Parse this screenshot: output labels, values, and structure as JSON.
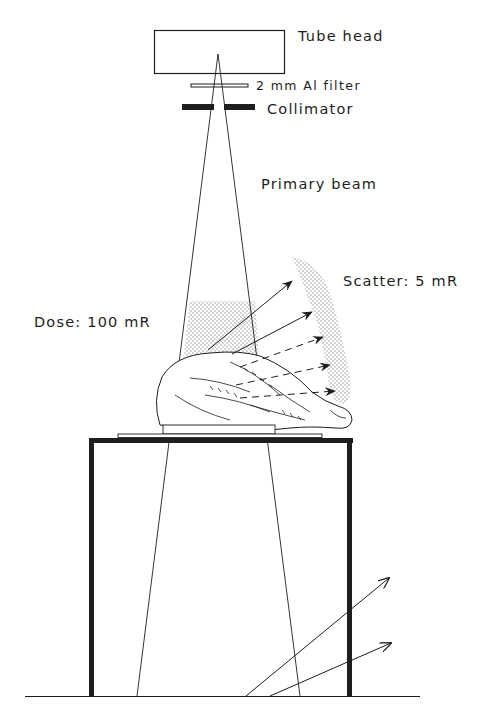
{
  "diagram": {
    "type": "radiography-scatter-setup",
    "labels": {
      "tube_head": "Tube head",
      "filter": "2 mm Al filter",
      "collimator": "Collimator",
      "primary_beam": "Primary beam",
      "dose": "Dose: 100 mR",
      "scatter": "Scatter: 5 mR"
    },
    "components": [
      {
        "id": "tube-head",
        "label": "Tube head"
      },
      {
        "id": "al-filter",
        "label": "2 mm Al filter"
      },
      {
        "id": "collimator",
        "label": "Collimator"
      },
      {
        "id": "primary-beam",
        "label": "Primary beam"
      },
      {
        "id": "dose-region",
        "label": "Dose: 100 mR"
      },
      {
        "id": "scatter-region",
        "label": "Scatter: 5 mR"
      },
      {
        "id": "animal-subject",
        "label": ""
      },
      {
        "id": "table",
        "label": ""
      },
      {
        "id": "floor",
        "label": ""
      }
    ],
    "colors": {
      "ink": "#1e1e1e",
      "background": "#ffffff",
      "stipple": "#9a9a9a"
    }
  }
}
